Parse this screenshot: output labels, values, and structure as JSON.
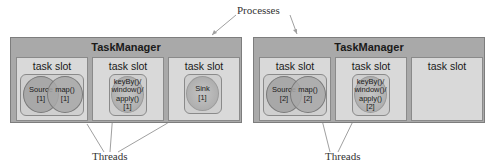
{
  "labels": {
    "processes": "Processes",
    "threads": "Threads"
  },
  "taskmanagers": [
    {
      "title": "TaskManager",
      "slots": [
        {
          "title": "task slot",
          "operators": [
            {
              "name": "Source",
              "index": "[1]"
            },
            {
              "name": "map()",
              "index": "[1]"
            }
          ]
        },
        {
          "title": "task slot",
          "operators": [
            {
              "lines": [
                "keyBy()/",
                "window()/",
                "apply()"
              ],
              "index": "[1]"
            }
          ]
        },
        {
          "title": "task slot",
          "operators": [
            {
              "name": "Sink",
              "index": "[1]"
            }
          ]
        }
      ]
    },
    {
      "title": "TaskManager",
      "slots": [
        {
          "title": "task slot",
          "operators": [
            {
              "name": "Source",
              "index": "[2]"
            },
            {
              "name": "map()",
              "index": "[2]"
            }
          ]
        },
        {
          "title": "task slot",
          "operators": [
            {
              "lines": [
                "keyBy()/",
                "window()/",
                "apply()"
              ],
              "index": "[2]"
            }
          ]
        },
        {
          "title": "task slot",
          "operators": []
        }
      ]
    }
  ],
  "colors": {
    "taskmanager": "#a9a9a9",
    "slot": "#d9d9d9",
    "operator": "#a8a8a8",
    "line": "#b0b0b0"
  }
}
